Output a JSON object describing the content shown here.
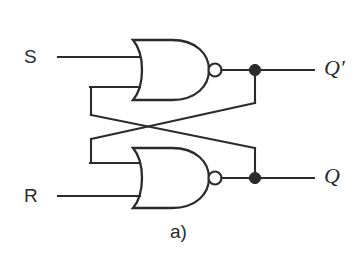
{
  "figure": {
    "caption": "a)",
    "background_color": "#ffffff",
    "line_color": "#2b2b2b",
    "type": "logic-circuit-schematic"
  },
  "inputs": [
    {
      "id": "s",
      "label": "S"
    },
    {
      "id": "r",
      "label": "R"
    }
  ],
  "outputs": [
    {
      "id": "qbar",
      "label": "Q′"
    },
    {
      "id": "q",
      "label": "Q"
    }
  ],
  "gates": [
    {
      "id": "gate-top",
      "type": "NOR",
      "inverting_bubble": true
    },
    {
      "id": "gate-bottom",
      "type": "NOR",
      "inverting_bubble": true
    }
  ],
  "junctions": [
    {
      "id": "junction-qbar"
    },
    {
      "id": "junction-q"
    }
  ]
}
